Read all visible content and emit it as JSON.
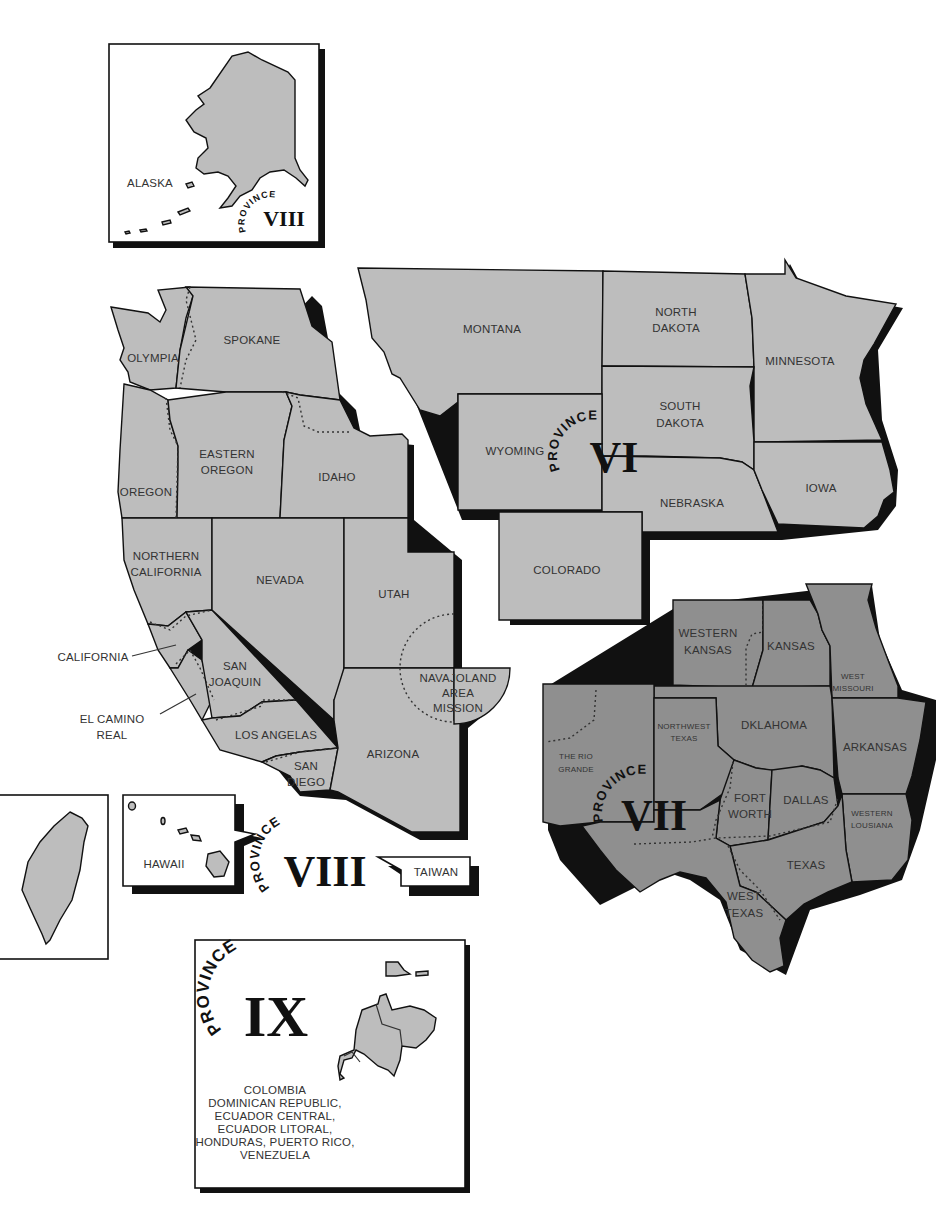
{
  "map": {
    "title": "Episcopal Church Provinces VI, VII, VIII, IX",
    "colors": {
      "province_vi_viii_fill": "#bdbdbd",
      "province_vii_fill": "#8f8f8f",
      "outline": "#111111",
      "label": "#333333",
      "background": "#ffffff"
    },
    "insets": {
      "alaska": {
        "label": "ALASKA",
        "province_word": "PROVINCE",
        "province_numeral": "VIII"
      },
      "hawaii": {
        "label": "HAWAII"
      },
      "taiwan": {
        "label": "TAIWAN"
      },
      "province_ix": {
        "province_word": "PROVINCE",
        "province_numeral": "IX",
        "dioceses_lines": [
          "COLOMBIA",
          "DOMINICAN REPUBLIC,",
          "ECUADOR CENTRAL,",
          "ECUADOR LITORAL,",
          "HONDURAS, PUERTO RICO,",
          "VENEZUELA"
        ]
      }
    },
    "province_viii": {
      "province_word": "PROVINCE",
      "province_numeral": "VIII",
      "regions": {
        "olympia": "OLYMPIA",
        "spokane": "SPOKANE",
        "eastern_oregon_1": "EASTERN",
        "eastern_oregon_2": "OREGON",
        "oregon": "OREGON",
        "idaho": "IDAHO",
        "northern_california_1": "NORTHERN",
        "northern_california_2": "CALIFORNIA",
        "nevada": "NEVADA",
        "utah": "UTAH",
        "california_callout": "CALIFORNIA",
        "san_joaquin_1": "SAN",
        "san_joaquin_2": "JOAQUIN",
        "el_camino_real_1": "EL CAMINO",
        "el_camino_real_2": "REAL",
        "navajoland_1": "NAVAJOLAND",
        "navajoland_2": "AREA",
        "navajoland_3": "MISSION",
        "los_angeles": "LOS ANGELAS",
        "san_diego_1": "SAN",
        "san_diego_2": "DIEGO",
        "arizona": "ARIZONA"
      }
    },
    "province_vi": {
      "province_word": "PROVINCE",
      "province_numeral": "VI",
      "regions": {
        "montana": "MONTANA",
        "north_dakota_1": "NORTH",
        "north_dakota_2": "DAKOTA",
        "minnesota": "MINNESOTA",
        "south_dakota_1": "SOUTH",
        "south_dakota_2": "DAKOTA",
        "wyoming": "WYOMING",
        "nebraska": "NEBRASKA",
        "iowa": "IOWA",
        "colorado": "COLORADO"
      }
    },
    "province_vii": {
      "province_word": "PROVINCE",
      "province_numeral": "VII",
      "regions": {
        "western_kansas_1": "WESTERN",
        "western_kansas_2": "KANSAS",
        "kansas": "KANSAS",
        "west_missouri_1": "WEST",
        "west_missouri_2": "MISSOURI",
        "oklahoma": "DKLAHOMA",
        "arkansas": "ARKANSAS",
        "northwest_texas_1": "NORTHWEST",
        "northwest_texas_2": "TEXAS",
        "rio_grande_1": "THE RIO",
        "rio_grande_2": "GRANDE",
        "fort_worth_1": "FORT",
        "fort_worth_2": "WORTH",
        "dallas": "DALLAS",
        "western_louisiana_1": "WESTERN",
        "western_louisiana_2": "LOUSIANA",
        "texas": "TEXAS",
        "west_texas_1": "WEST",
        "west_texas_2": "TEXAS"
      }
    }
  }
}
